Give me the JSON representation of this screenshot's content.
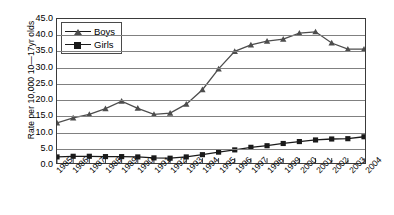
{
  "chart_data": {
    "type": "line",
    "title": "",
    "xlabel": "",
    "ylabel": "Rate per 10,000 10—17yr olds",
    "ylim": [
      0,
      45
    ],
    "ytick_step": 5,
    "grid": true,
    "legend_position": "top-left-inside",
    "categories": [
      "1985",
      "1986",
      "1987",
      "1988",
      "1989",
      "1990",
      "1991",
      "1992",
      "1993",
      "1994",
      "1995",
      "1996",
      "1997",
      "1998",
      "1999",
      "2000",
      "2001",
      "2002",
      "2003",
      "2004"
    ],
    "ytick_labels": [
      "0.0",
      "5.0",
      "10.0",
      "15.0",
      "20.0",
      "25.0",
      "30.0",
      "35.0",
      "40.0",
      "45.0"
    ],
    "series": [
      {
        "name": "Boys",
        "marker": "triangle",
        "color": "#4d4d4d",
        "values": [
          12.5,
          14.1,
          15.2,
          17.0,
          19.3,
          17.1,
          15.2,
          15.6,
          18.4,
          22.9,
          29.4,
          34.9,
          36.9,
          38.1,
          38.7,
          40.6,
          41.0,
          37.5,
          35.6,
          35.6
        ]
      },
      {
        "name": "Girls",
        "marker": "square",
        "color": "#1a1a1a",
        "values": [
          1.9,
          2.1,
          2.1,
          2.0,
          2.0,
          1.9,
          1.6,
          1.5,
          1.9,
          2.6,
          3.4,
          4.1,
          4.9,
          5.4,
          6.1,
          6.7,
          7.2,
          7.5,
          7.6,
          8.2
        ]
      }
    ]
  },
  "legend": {
    "items": [
      {
        "label": "Boys"
      },
      {
        "label": "Girls"
      }
    ]
  }
}
